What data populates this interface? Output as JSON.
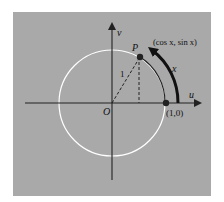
{
  "diagram": {
    "colors": {
      "background": "#a9a9a9",
      "circle": "#ffffff",
      "axes": "#222222",
      "arc": "#111111"
    },
    "labels": {
      "v_axis": "v",
      "u_axis": "u",
      "origin": "O",
      "point_p": "P",
      "point_p_coords": "(cos x, sin x)",
      "radius": "1",
      "arc_length": "x",
      "point_one_zero": "(1,0)"
    }
  }
}
